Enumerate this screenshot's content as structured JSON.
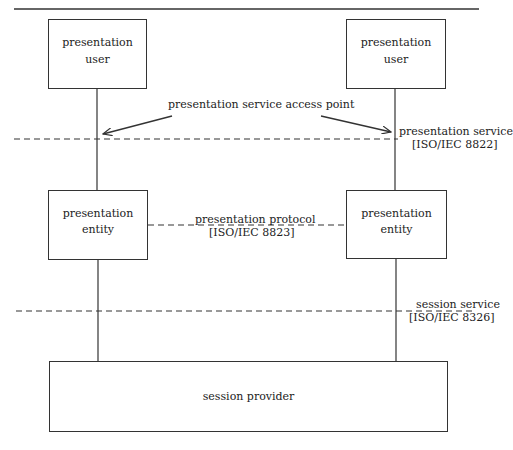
{
  "diagram": {
    "boxes": {
      "user_left": {
        "line1": "presentation",
        "line2": "user"
      },
      "user_right": {
        "line1": "presentation",
        "line2": "user"
      },
      "entity_left": {
        "line1": "presentation",
        "line2": "entity"
      },
      "entity_right": {
        "line1": "presentation",
        "line2": "entity"
      },
      "session_provider": {
        "label": "session provider"
      }
    },
    "labels": {
      "access_point": "presentation service access point",
      "presentation_service": "presentation service",
      "presentation_service_std": "[ISO/IEC 8822]",
      "presentation_protocol": "presentation protocol",
      "presentation_protocol_std": "[ISO/IEC 8823]",
      "session_service": "session service",
      "session_service_std": "[ISO/IEC 8326]"
    },
    "colors": {
      "line": "#333333",
      "text": "#222222",
      "background": "#ffffff"
    }
  }
}
